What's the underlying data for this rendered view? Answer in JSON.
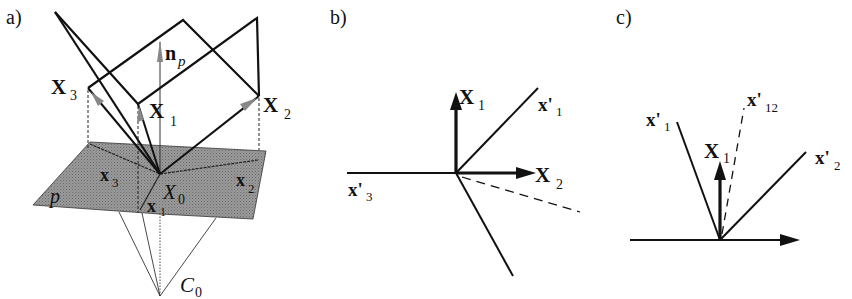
{
  "figure": {
    "panels": [
      {
        "id": "a",
        "label": "a)",
        "points": {
          "X3": "X",
          "X3_sub": "3",
          "X1": "X",
          "X1_sub": "1",
          "X2": "X",
          "X2_sub": "2",
          "np": "n",
          "np_sub": "p",
          "x3": "x",
          "x3_sub": "3",
          "x2": "x",
          "x2_sub": "2",
          "x1": "x",
          "x1_sub": "1",
          "X0": "X",
          "X0_sub": "0",
          "plane": "p",
          "C0": "C",
          "C0_sub": "0"
        },
        "colors": {
          "plane_fill": "#8a8a8a",
          "line": "#111111",
          "arrow_gray": "#777777"
        }
      },
      {
        "id": "b",
        "label": "b)",
        "labels": {
          "X1": "X",
          "X1_sub": "1",
          "x1p": "x'",
          "x1p_sub": "1",
          "X2": "X",
          "X2_sub": "2",
          "x3p": "x'",
          "x3p_sub": "3"
        }
      },
      {
        "id": "c",
        "label": "c)",
        "labels": {
          "x12p": "x'",
          "x12p_sub": "12",
          "x1p": "x'",
          "x1p_sub": "1",
          "X1": "X",
          "X1_sub": "1",
          "x2p": "x'",
          "x2p_sub": "2"
        }
      }
    ]
  }
}
